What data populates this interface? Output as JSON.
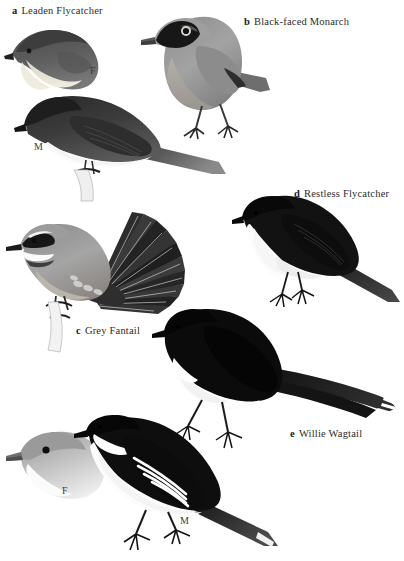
{
  "plate": {
    "title": "Monarch flycatchers and fantails plate",
    "background_color": "#ffffff",
    "width": 404,
    "height": 561,
    "ink_color": "#1a1a1a",
    "label_color": "#2b2b2b"
  },
  "species": [
    {
      "letter": "a",
      "name": "Leaden Flycatcher",
      "label_x": 12,
      "label_y": 5,
      "figures": [
        {
          "sex": "F",
          "kind": "head-bust",
          "sex_x": 90,
          "sex_y": 65
        },
        {
          "sex": "M",
          "kind": "perched-full",
          "sex_x": 34,
          "sex_y": 141
        }
      ]
    },
    {
      "letter": "b",
      "name": "Black-faced Monarch",
      "label_x": 244,
      "label_y": 16,
      "figures": [
        {
          "sex": "",
          "kind": "standing-full",
          "sex_x": 0,
          "sex_y": 0
        }
      ]
    },
    {
      "letter": "c",
      "name": "Grey Fantail",
      "label_x": 76,
      "label_y": 325,
      "figures": [
        {
          "sex": "",
          "kind": "fanned-tail-perched",
          "sex_x": 0,
          "sex_y": 0
        }
      ]
    },
    {
      "letter": "d",
      "name": "Restless Flycatcher",
      "label_x": 294,
      "label_y": 188,
      "figures": [
        {
          "sex": "",
          "kind": "perched-full",
          "sex_x": 0,
          "sex_y": 0
        }
      ]
    },
    {
      "letter": "e",
      "name": "Willie Wagtail",
      "label_x": 290,
      "label_y": 428,
      "figures": [
        {
          "sex": "",
          "kind": "long-tail-perched",
          "sex_x": 0,
          "sex_y": 0
        }
      ]
    }
  ],
  "bottom_pair": {
    "female": {
      "sex": "F",
      "kind": "head-bust-pale",
      "sex_x": 62,
      "sex_y": 485
    },
    "male": {
      "sex": "M",
      "kind": "perched-wingbars",
      "sex_x": 180,
      "sex_y": 515
    }
  }
}
